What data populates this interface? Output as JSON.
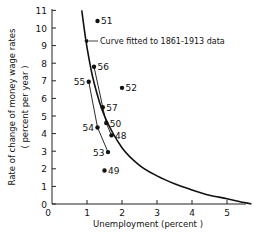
{
  "chart_data": {
    "type": "scatter",
    "title": "",
    "xlabel": "Unemployment (percent )",
    "ylabel": "Rate of change of money wage rates",
    "ylabel_sub": "( percent per year )",
    "xlim": [
      0,
      5.7
    ],
    "ylim": [
      0,
      11
    ],
    "x_ticks": [
      0,
      1,
      2,
      3,
      4,
      5
    ],
    "y_ticks": [
      0,
      1,
      2,
      3,
      4,
      5,
      6,
      7,
      8,
      9,
      10,
      11
    ],
    "grid": false,
    "legend": null,
    "annotation": "Curve fitted to 1861-1913 data",
    "series": [
      {
        "name": "Observations 1948-1957",
        "type": "scatter",
        "points": [
          {
            "label": "48",
            "x": 1.7,
            "y": 3.9
          },
          {
            "label": "49",
            "x": 1.5,
            "y": 1.9
          },
          {
            "label": "50",
            "x": 1.55,
            "y": 4.6
          },
          {
            "label": "51",
            "x": 1.3,
            "y": 10.4
          },
          {
            "label": "52",
            "x": 2.0,
            "y": 6.6
          },
          {
            "label": "53",
            "x": 1.6,
            "y": 2.95
          },
          {
            "label": "54",
            "x": 1.3,
            "y": 4.35
          },
          {
            "label": "55",
            "x": 1.05,
            "y": 6.95
          },
          {
            "label": "56",
            "x": 1.2,
            "y": 7.8
          },
          {
            "label": "57",
            "x": 1.45,
            "y": 5.5
          }
        ]
      },
      {
        "name": "Curve fitted to 1861-1913 data",
        "type": "line",
        "x": [
          0.85,
          1.0,
          1.2,
          1.5,
          2.0,
          2.5,
          3.0,
          3.5,
          4.0,
          4.5,
          5.0,
          5.5,
          5.7
        ],
        "y": [
          11.0,
          8.9,
          6.9,
          5.0,
          3.2,
          2.2,
          1.6,
          1.15,
          0.8,
          0.5,
          0.3,
          0.08,
          0.0
        ]
      }
    ],
    "connecting_lines": [
      [
        "56",
        "57"
      ],
      [
        "57",
        "50"
      ],
      [
        "50",
        "48"
      ],
      [
        "55",
        "54"
      ],
      [
        "54",
        "53"
      ]
    ],
    "label_positions": {
      "48": "right",
      "49": "right",
      "50": "right",
      "51": "right",
      "52": "right",
      "53": "left",
      "54": "left",
      "55": "left",
      "56": "right",
      "57": "right"
    }
  }
}
